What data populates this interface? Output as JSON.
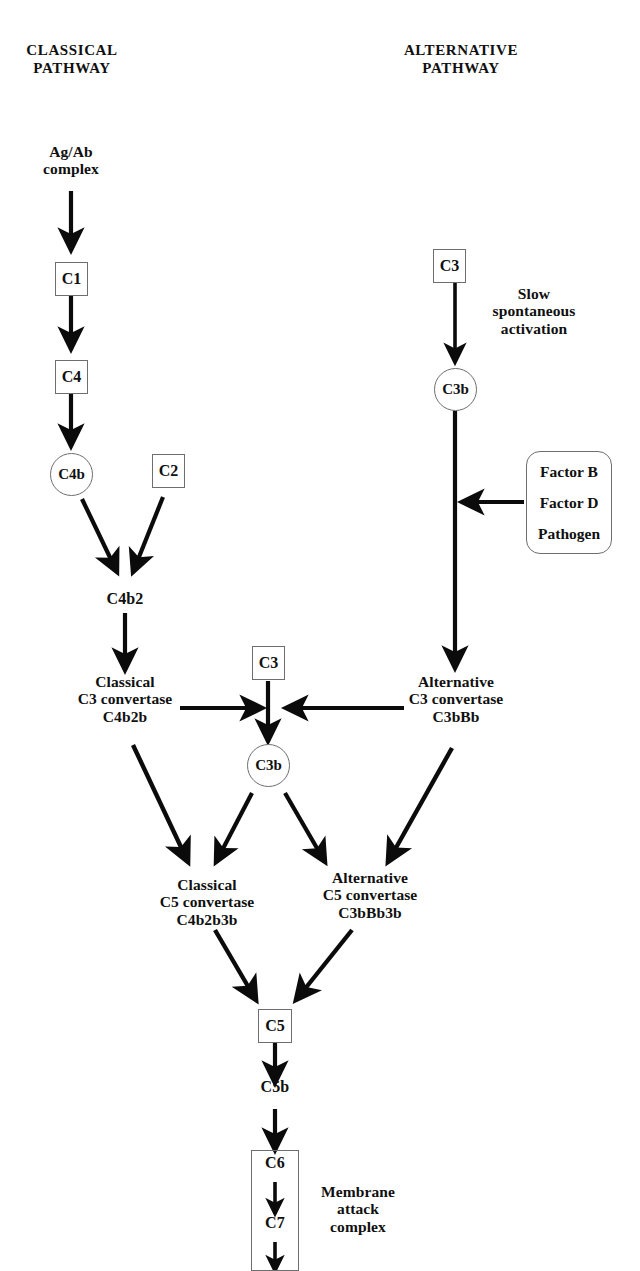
{
  "diagram": {
    "headers": {
      "classical": "CLASSICAL\nPATHWAY",
      "alternative": "ALTERNATIVE\nPATHWAY"
    },
    "colors": {
      "ink": "#101010",
      "outline": "#6e6e6e",
      "background": "#ffffff"
    },
    "nodes": {
      "ag_ab_complex": "Ag/Ab\ncomplex",
      "c1": "C1",
      "c4": "C4",
      "c4b": "C4b",
      "c2": "C2",
      "c4b2": "C4b2",
      "classical_c3_convertase": "Classical\nC3 convertase\nC4b2b",
      "c3_top_right": "C3",
      "slow_activation": "Slow\nspontaneous\nactivation",
      "c3b_right": "C3b",
      "factor_group": [
        "Factor B",
        "Factor D",
        "Pathogen"
      ],
      "alternative_c3_convertase": "Alternative\nC3 convertase\nC3bBb",
      "c3_middle": "C3",
      "c3b_middle": "C3b",
      "classical_c5_convertase": "Classical\nC5 convertase\nC4b2b3b",
      "alternative_c5_convertase": "Alternative\nC5 convertase\nC3bBb3b",
      "c5": "C5",
      "c5b": "C5b",
      "c6": "C6",
      "c7": "C7",
      "membrane_attack_complex": "Membrane\nattack\ncomplex"
    }
  }
}
